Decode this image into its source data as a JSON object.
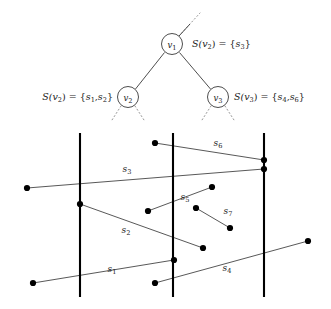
{
  "figure": {
    "tree": {
      "nodes": [
        {
          "id": "v1",
          "label": "v",
          "sub": "1",
          "cx": 172,
          "cy": 44,
          "r": 10.5
        },
        {
          "id": "v2",
          "label": "v",
          "sub": "2",
          "cx": 128,
          "cy": 97,
          "r": 10.5
        },
        {
          "id": "v3",
          "label": "v",
          "sub": "3",
          "cx": 218,
          "cy": 97,
          "r": 10.5
        }
      ],
      "edges": [
        {
          "from": "v1",
          "to": "v2",
          "style": "solid"
        },
        {
          "from": "v1",
          "to": "v3",
          "style": "solid"
        },
        {
          "from": "v1",
          "to": "parent",
          "style": "dotted"
        },
        {
          "from": "v2",
          "to": "child-left",
          "style": "dotted"
        },
        {
          "from": "v2",
          "to": "child-right",
          "style": "dotted"
        },
        {
          "from": "v3",
          "to": "child-left",
          "style": "dotted"
        },
        {
          "from": "v3",
          "to": "child-right",
          "style": "dotted"
        }
      ],
      "set_labels": [
        {
          "id": "label-v1",
          "anchor": "start",
          "x": 192,
          "y": 47,
          "parts": [
            {
              "t": "S(",
              "k": "it"
            },
            {
              "t": "v",
              "k": "it"
            },
            {
              "t": "2",
              "k": "sub"
            },
            {
              "t": ") = {",
              "k": "up"
            },
            {
              "t": "s",
              "k": "it"
            },
            {
              "t": "3",
              "k": "sub"
            },
            {
              "t": "}",
              "k": "up"
            }
          ],
          "text": "S(v2) = {s3}"
        },
        {
          "id": "label-v2",
          "anchor": "end",
          "x": 113,
          "y": 100,
          "parts": [
            {
              "t": "S(",
              "k": "it"
            },
            {
              "t": "v",
              "k": "it"
            },
            {
              "t": "2",
              "k": "sub"
            },
            {
              "t": ") = {",
              "k": "up"
            },
            {
              "t": "s",
              "k": "it"
            },
            {
              "t": "1",
              "k": "sub"
            },
            {
              "t": ",",
              "k": "up"
            },
            {
              "t": "s",
              "k": "it"
            },
            {
              "t": "2",
              "k": "sub"
            },
            {
              "t": "}",
              "k": "up"
            }
          ],
          "text": "S(v2) = {s1,s2}"
        },
        {
          "id": "label-v3",
          "anchor": "start",
          "x": 234,
          "y": 100,
          "parts": [
            {
              "t": "S(",
              "k": "it"
            },
            {
              "t": "v",
              "k": "it"
            },
            {
              "t": "3",
              "k": "sub"
            },
            {
              "t": ") = {",
              "k": "up"
            },
            {
              "t": "s",
              "k": "it"
            },
            {
              "t": "4",
              "k": "sub"
            },
            {
              "t": ",",
              "k": "up"
            },
            {
              "t": "s",
              "k": "it"
            },
            {
              "t": "6",
              "k": "sub"
            },
            {
              "t": "}",
              "k": "up"
            }
          ],
          "text": "S(v3) = {s4,s6}"
        }
      ]
    },
    "arrangement": {
      "vertical_lines": [
        {
          "id": "slab-line-left",
          "x": 80,
          "y1": 133,
          "y2": 297
        },
        {
          "id": "slab-line-middle",
          "x": 173,
          "y1": 133,
          "y2": 297
        },
        {
          "id": "slab-line-right",
          "x": 264,
          "y1": 133,
          "y2": 297
        }
      ],
      "segments": [
        {
          "id": "s1",
          "label": "s",
          "sub": "1",
          "x1": 33,
          "y1": 283,
          "x2": 174,
          "y2": 260,
          "label_x": 112,
          "label_y": 272,
          "dot_start": true,
          "dot_end": true
        },
        {
          "id": "s2",
          "label": "s",
          "sub": "2",
          "x1": 80,
          "y1": 204,
          "x2": 203,
          "y2": 248,
          "label_x": 126,
          "label_y": 233,
          "dot_start": true,
          "dot_end": true
        },
        {
          "id": "s3",
          "label": "s",
          "sub": "3",
          "x1": 27,
          "y1": 188,
          "x2": 264,
          "y2": 169,
          "label_x": 127,
          "label_y": 172,
          "dot_start": true,
          "dot_end": true
        },
        {
          "id": "s4",
          "label": "s",
          "sub": "4",
          "x1": 155,
          "y1": 283,
          "x2": 308,
          "y2": 241,
          "label_x": 227,
          "label_y": 271,
          "dot_start": true,
          "dot_end": true
        },
        {
          "id": "s5",
          "label": "s",
          "sub": "5",
          "x1": 148,
          "y1": 211,
          "x2": 212,
          "y2": 187,
          "label_x": 185,
          "label_y": 200,
          "dot_start": true,
          "dot_end": true
        },
        {
          "id": "s6",
          "label": "s",
          "sub": "6",
          "x1": 155,
          "y1": 143,
          "x2": 264,
          "y2": 160,
          "label_x": 218,
          "label_y": 146,
          "dot_start": true,
          "dot_end": true
        },
        {
          "id": "s7",
          "label": "s",
          "sub": "7",
          "x1": 196,
          "y1": 208,
          "x2": 230,
          "y2": 228,
          "label_x": 228,
          "label_y": 214,
          "dot_start": true,
          "dot_end": true
        }
      ],
      "extra_dots": [
        {
          "id": "dot-s2-on-left-line",
          "x": 80,
          "y": 204
        },
        {
          "id": "dot-s1-on-middle-line",
          "x": 174,
          "y": 260
        },
        {
          "id": "dot-s6-on-right-line",
          "x": 264,
          "y": 160
        },
        {
          "id": "dot-s3-on-right-line",
          "x": 264,
          "y": 169
        }
      ]
    }
  }
}
